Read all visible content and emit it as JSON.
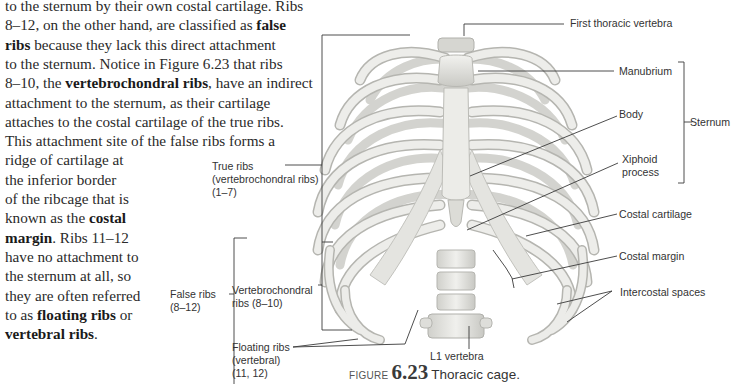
{
  "body_text": {
    "lines": [
      {
        "segments": [
          {
            "text": "to the sternum by their own costal cartilage. Ribs",
            "bold": false
          }
        ]
      },
      {
        "segments": [
          {
            "text": "8–12, on the other hand, are classified as ",
            "bold": false
          },
          {
            "text": "false",
            "bold": true
          }
        ]
      },
      {
        "segments": [
          {
            "text": "ribs",
            "bold": true
          },
          {
            "text": " because they lack this direct attachment",
            "bold": false
          }
        ]
      },
      {
        "segments": [
          {
            "text": "to the sternum. Notice in Figure 6.23 that ribs",
            "bold": false
          }
        ]
      },
      {
        "segments": [
          {
            "text": "8–10, the ",
            "bold": false
          },
          {
            "text": "vertebrochondral ribs",
            "bold": true
          },
          {
            "text": ", have an indirect",
            "bold": false
          }
        ]
      },
      {
        "segments": [
          {
            "text": "attachment to the sternum, as their cartilage",
            "bold": false
          }
        ]
      },
      {
        "segments": [
          {
            "text": "attaches to the costal cartilage of the true ribs.",
            "bold": false
          }
        ]
      },
      {
        "segments": [
          {
            "text": "This attachment site of the false ribs forms a",
            "bold": false
          }
        ]
      },
      {
        "segments": [
          {
            "text": "ridge of cartilage at",
            "bold": false
          }
        ]
      },
      {
        "segments": [
          {
            "text": "the inferior border",
            "bold": false
          }
        ]
      },
      {
        "segments": [
          {
            "text": "of the ribcage that is",
            "bold": false
          }
        ]
      },
      {
        "segments": [
          {
            "text": "known as the ",
            "bold": false
          },
          {
            "text": "costal",
            "bold": true
          }
        ]
      },
      {
        "segments": [
          {
            "text": "margin",
            "bold": true
          },
          {
            "text": ". Ribs 11–12",
            "bold": false
          }
        ]
      },
      {
        "segments": [
          {
            "text": "have no attachment to",
            "bold": false
          }
        ]
      },
      {
        "segments": [
          {
            "text": "the sternum at all, so",
            "bold": false
          }
        ]
      },
      {
        "segments": [
          {
            "text": "they are often referred",
            "bold": false
          }
        ]
      },
      {
        "segments": [
          {
            "text": "to as ",
            "bold": false
          },
          {
            "text": "floating ribs",
            "bold": true
          },
          {
            "text": " or",
            "bold": false
          }
        ]
      },
      {
        "segments": [
          {
            "text": "vertebral ribs",
            "bold": true
          },
          {
            "text": ".",
            "bold": false
          }
        ]
      }
    ]
  },
  "figure": {
    "labels": {
      "first_thoracic_vertebra": "First thoracic vertebra",
      "manubrium": "Manubrium",
      "body": "Body",
      "xiphoid_1": "Xiphoid",
      "xiphoid_2": "process",
      "sternum": "Sternum",
      "costal_cartilage": "Costal cartilage",
      "costal_margin": "Costal margin",
      "intercostal_spaces": "Intercostal spaces",
      "true_ribs_1": "True ribs",
      "true_ribs_2": "(vertebrochondral ribs)",
      "true_ribs_3": "(1–7)",
      "false_ribs_1": "False ribs",
      "false_ribs_2": "(8–12)",
      "vertebrochondral_1": "Vertebrochondral",
      "vertebrochondral_2": "ribs (8–10)",
      "floating_1": "Floating ribs",
      "floating_2": "(vertebral)",
      "floating_3": "(11, 12)",
      "l1_vertebra": "L1 vertebra"
    },
    "caption": {
      "word": "FIGURE",
      "number": "6.23",
      "title": "Thoracic cage."
    },
    "colors": {
      "bone": "#e6e6e3",
      "bone_shadow": "#bdbdb8",
      "cartilage": "#d9d9d4",
      "leader": "#333333"
    }
  }
}
